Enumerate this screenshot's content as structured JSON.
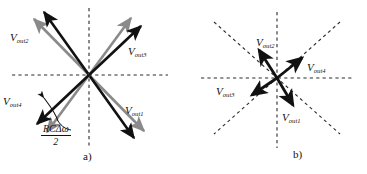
{
  "figure": {
    "background": "#ffffff",
    "vector_color_primary": "#111111",
    "vector_color_secondary": "#8a8a8a",
    "axis_color": "#2a2a2a"
  },
  "panel_a": {
    "caption": "a)",
    "center": {
      "x": 89,
      "y": 75
    },
    "labels": {
      "out1": {
        "v": "V",
        "sub": "out1"
      },
      "out2": {
        "v": "V",
        "sub": "out2"
      },
      "out3": {
        "v": "V",
        "sub": "out3"
      },
      "out4": {
        "v": "V",
        "sub": "out4"
      }
    },
    "annotation": {
      "numerator": "RCΔω",
      "denominator": "2"
    }
  },
  "panel_b": {
    "caption": "b)",
    "center": {
      "x": 94,
      "y": 78
    },
    "labels": {
      "out1": {
        "v": "V",
        "sub": "out1"
      },
      "out2": {
        "v": "V",
        "sub": "out2"
      },
      "out3": {
        "v": "V",
        "sub": "out3"
      },
      "out4": {
        "v": "V",
        "sub": "out4"
      }
    }
  }
}
